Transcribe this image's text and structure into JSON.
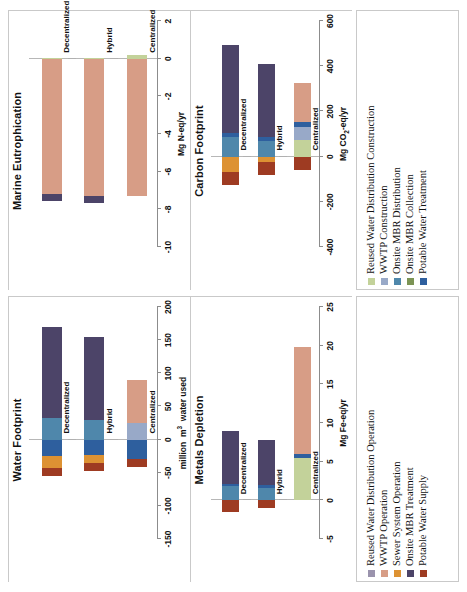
{
  "figure": {
    "orientation": "rotated-90-ccw",
    "categories": [
      "Decentralized",
      "Hybrid",
      "Centralized"
    ]
  },
  "legend_top": {
    "items": [
      {
        "label": "Reused Water Distribution Construction",
        "color": "#c3d29a"
      },
      {
        "label": "WWTP Construction",
        "color": "#98a9c8"
      },
      {
        "label": "Onsite MBR Distribution",
        "color": "#4f87ab"
      },
      {
        "label": "Onsite MBR Collection",
        "color": "#7c9455"
      },
      {
        "label": "Potable Water Treatment",
        "color": "#2e5f9e"
      }
    ]
  },
  "legend_bottom": {
    "items": [
      {
        "label": "Reused Water Distribution Operation",
        "color": "#9a93ad"
      },
      {
        "label": "WWTP Operation",
        "color": "#d79d86"
      },
      {
        "label": "Sewer System Operation",
        "color": "#dd9233"
      },
      {
        "label": "Onsite MBR Treatment",
        "color": "#4c4468"
      },
      {
        "label": "Potable Water Supply",
        "color": "#9e3b22"
      }
    ]
  },
  "chart_data": [
    {
      "id": "marine",
      "type": "bar",
      "orientation": "horizontal-stacked",
      "title": "Marine Eutrophication",
      "xlabel": "",
      "ylabel": "Mg N-eq/yr",
      "categories": [
        "Decentralized",
        "Hybrid",
        "Centralized"
      ],
      "ylim": [
        -10,
        2
      ],
      "ticks": [
        2,
        0,
        -2,
        -4,
        -6,
        -8,
        -10
      ],
      "grid": false,
      "series": [
        {
          "name": "Reused Water Distribution Construction",
          "color": "#c3d29a",
          "values": [
            0.05,
            0.05,
            0.22
          ]
        },
        {
          "name": "WWTP Construction",
          "color": "#98a9c8",
          "values": [
            0.0,
            0.0,
            0.0
          ]
        },
        {
          "name": "Onsite MBR Distribution",
          "color": "#4f87ab",
          "values": [
            0.0,
            0.0,
            0.0
          ]
        },
        {
          "name": "Onsite MBR Collection",
          "color": "#7c9455",
          "values": [
            0.0,
            0.0,
            0.0
          ]
        },
        {
          "name": "Potable Water Treatment",
          "color": "#2e5f9e",
          "values": [
            0.0,
            0.0,
            0.0
          ]
        },
        {
          "name": "Reused Water Distribution Operation",
          "color": "#9a93ad",
          "values": [
            0.0,
            0.0,
            0.0
          ]
        },
        {
          "name": "WWTP Operation",
          "color": "#d79d86",
          "values": [
            -7.2,
            -7.3,
            -7.3
          ]
        },
        {
          "name": "Sewer System Operation",
          "color": "#dd9233",
          "values": [
            0.0,
            0.0,
            0.0
          ]
        },
        {
          "name": "Onsite MBR Treatment",
          "color": "#4c4468",
          "values": [
            -0.35,
            -0.35,
            0.0
          ]
        },
        {
          "name": "Potable Water Supply",
          "color": "#9e3b22",
          "values": [
            0.0,
            0.0,
            0.0
          ]
        }
      ],
      "totals": [
        -7.5,
        -7.6,
        -7.3
      ]
    },
    {
      "id": "carbon",
      "type": "bar",
      "orientation": "horizontal-stacked",
      "title": "Carbon Footprint",
      "xlabel": "",
      "ylabel": "Mg CO2-eq/yr",
      "categories": [
        "Decentralized",
        "Hybrid",
        "Centralized"
      ],
      "ylim": [
        -400,
        600
      ],
      "ticks": [
        600,
        400,
        200,
        0,
        -200,
        -400
      ],
      "grid": false,
      "series": [
        {
          "name": "Reused Water Distribution Construction",
          "color": "#c3d29a",
          "values": [
            0,
            0,
            75
          ]
        },
        {
          "name": "WWTP Construction",
          "color": "#98a9c8",
          "values": [
            0,
            0,
            55
          ]
        },
        {
          "name": "Onsite MBR Distribution",
          "color": "#4f87ab",
          "values": [
            85,
            70,
            0
          ]
        },
        {
          "name": "Onsite MBR Collection",
          "color": "#7c9455",
          "values": [
            0,
            0,
            0
          ]
        },
        {
          "name": "Potable Water Treatment",
          "color": "#2e5f9e",
          "values": [
            18,
            18,
            22
          ]
        },
        {
          "name": "Reused Water Distribution Operation",
          "color": "#9a93ad",
          "values": [
            0,
            0,
            0
          ]
        },
        {
          "name": "WWTP Operation",
          "color": "#d79d86",
          "values": [
            0,
            0,
            175
          ]
        },
        {
          "name": "Sewer System Operation",
          "color": "#dd9233",
          "values": [
            -70,
            -22,
            0
          ]
        },
        {
          "name": "Onsite MBR Treatment",
          "color": "#4c4468",
          "values": [
            390,
            320,
            0
          ]
        },
        {
          "name": "Potable Water Supply",
          "color": "#9e3b22",
          "values": [
            -55,
            -58,
            -60
          ]
        }
      ],
      "totals": [
        490,
        410,
        325
      ]
    },
    {
      "id": "water",
      "type": "bar",
      "orientation": "horizontal-stacked",
      "title": "Water Footprint",
      "xlabel": "",
      "ylabel": "million m3 water used",
      "categories": [
        "Decentralized",
        "Hybrid",
        "Centralized"
      ],
      "ylim": [
        -150,
        200
      ],
      "ticks": [
        200,
        150,
        100,
        50,
        0,
        -50,
        -100,
        -150
      ],
      "grid": false,
      "series": [
        {
          "name": "Reused Water Distribution Construction",
          "color": "#c3d29a",
          "values": [
            0,
            0,
            0
          ]
        },
        {
          "name": "WWTP Construction",
          "color": "#98a9c8",
          "values": [
            0,
            0,
            25
          ]
        },
        {
          "name": "Onsite MBR Distribution",
          "color": "#4f87ab",
          "values": [
            33,
            30,
            0
          ]
        },
        {
          "name": "Onsite MBR Collection",
          "color": "#7c9455",
          "values": [
            0,
            0,
            0
          ]
        },
        {
          "name": "Potable Water Treatment",
          "color": "#2e5f9e",
          "values": [
            -25,
            -23,
            -30
          ]
        },
        {
          "name": "Reused Water Distribution Operation",
          "color": "#9a93ad",
          "values": [
            0,
            0,
            0
          ]
        },
        {
          "name": "WWTP Operation",
          "color": "#d79d86",
          "values": [
            0,
            0,
            65
          ]
        },
        {
          "name": "Sewer System Operation",
          "color": "#dd9233",
          "values": [
            -18,
            -12,
            0
          ]
        },
        {
          "name": "Onsite MBR Treatment",
          "color": "#4c4468",
          "values": [
            137,
            124,
            0
          ]
        },
        {
          "name": "Potable Water Supply",
          "color": "#9e3b22",
          "values": [
            -12,
            -12,
            -12
          ]
        }
      ],
      "totals": [
        170,
        155,
        90
      ]
    },
    {
      "id": "metals",
      "type": "bar",
      "orientation": "horizontal-stacked",
      "title": "Metals Depletion",
      "xlabel": "",
      "ylabel": "Mg Fe-eq/yr",
      "categories": [
        "Decentralized",
        "Hybrid",
        "Centralized"
      ],
      "ylim": [
        -5,
        25
      ],
      "ticks": [
        25,
        20,
        15,
        10,
        5,
        0,
        -5
      ],
      "grid": false,
      "series": [
        {
          "name": "Reused Water Distribution Construction",
          "color": "#c3d29a",
          "values": [
            0,
            0,
            5.5
          ]
        },
        {
          "name": "WWTP Construction",
          "color": "#98a9c8",
          "values": [
            0,
            0,
            0
          ]
        },
        {
          "name": "Onsite MBR Distribution",
          "color": "#4f87ab",
          "values": [
            1.8,
            1.6,
            0
          ]
        },
        {
          "name": "Onsite MBR Collection",
          "color": "#7c9455",
          "values": [
            0,
            0,
            0
          ]
        },
        {
          "name": "Potable Water Treatment",
          "color": "#2e5f9e",
          "values": [
            0.35,
            0.35,
            0.5
          ]
        },
        {
          "name": "Reused Water Distribution Operation",
          "color": "#9a93ad",
          "values": [
            0,
            0,
            0
          ]
        },
        {
          "name": "WWTP Operation",
          "color": "#d79d86",
          "values": [
            0,
            0,
            13.8
          ]
        },
        {
          "name": "Sewer System Operation",
          "color": "#dd9233",
          "values": [
            0,
            0,
            0
          ]
        },
        {
          "name": "Onsite MBR Treatment",
          "color": "#4c4468",
          "values": [
            6.8,
            5.9,
            0
          ]
        },
        {
          "name": "Potable Water Supply",
          "color": "#9e3b22",
          "values": [
            -1.5,
            -1.0,
            0
          ]
        }
      ],
      "totals": [
        8.95,
        7.85,
        19.8
      ]
    }
  ]
}
